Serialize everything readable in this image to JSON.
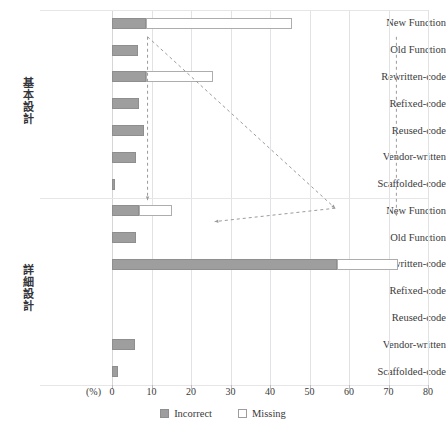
{
  "chart_data": {
    "type": "bar",
    "orientation": "horizontal",
    "stacked": true,
    "title": "",
    "xlabel": "(%)",
    "ylabel": "",
    "xlim": [
      0,
      80
    ],
    "xticks": [
      0,
      10,
      20,
      30,
      40,
      50,
      60,
      70,
      80
    ],
    "xtick_labels": [
      "0",
      "10",
      "20",
      "30",
      "40",
      "50",
      "60",
      "70",
      "80"
    ],
    "grid": true,
    "legend_position": "bottom-center",
    "legend": [
      "Incorrect",
      "Missing"
    ],
    "series": [
      {
        "name": "Incorrect",
        "color": "#9e9e9e",
        "values": [
          8.5,
          6.5,
          8.5,
          6.8,
          8.0,
          6.0,
          0.7,
          6.8,
          6.0,
          57.0,
          0.0,
          0.0,
          5.8,
          1.5
        ]
      },
      {
        "name": "Missing",
        "color": "#ffffff",
        "values": [
          37.0,
          0.0,
          17.0,
          0.0,
          0.0,
          0.0,
          0.0,
          8.5,
          0.0,
          15.5,
          0.0,
          0.0,
          0.0,
          0.0
        ]
      }
    ],
    "groups": [
      {
        "label": "基本設計",
        "categories": [
          "New Function",
          "Old Function",
          "Rewritten-code",
          "Refixed-code",
          "Reused-code",
          "Vendor-written",
          "Scaffolded-code"
        ]
      },
      {
        "label": "詳細設計",
        "categories": [
          "New Function",
          "Old Function",
          "Rewritten-code",
          "Refixed-code",
          "Reused-code",
          "Vendor-written",
          "Scaffolded-code"
        ]
      }
    ],
    "categories": [
      "New Function",
      "Old Function",
      "Rewritten-code",
      "Refixed-code",
      "Reused-code",
      "Vendor-written",
      "Scaffolded-code",
      "New Function",
      "Old Function",
      "Rewritten-code",
      "Refixed-code",
      "Reused-code",
      "Vendor-written",
      "Scaffolded-code"
    ],
    "annotations": [
      {
        "type": "dashed-connector",
        "style": "dashed",
        "color": "#9b9b9b",
        "from": [
          9.0,
          0.5
        ],
        "to": [
          9.0,
          6.6
        ],
        "note": "vertical dashed leader at ~9%"
      },
      {
        "type": "dashed-connector",
        "style": "dashed",
        "color": "#9b9b9b",
        "from": [
          9.0,
          0.5
        ],
        "to": [
          56.5,
          6.9
        ],
        "note": "diagonal dashed leader to right"
      },
      {
        "type": "dashed-connector",
        "style": "dashed",
        "color": "#9b9b9b",
        "from": [
          56.5,
          6.9
        ],
        "to": [
          26.0,
          7.4
        ],
        "note": "diagonal dashed leader returning left"
      },
      {
        "type": "dashed-connector",
        "style": "dashed",
        "color": "#9b9b9b",
        "from": [
          72.0,
          0.5
        ],
        "to": [
          72.0,
          7.2
        ],
        "note": "far right vertical dashed leader"
      }
    ]
  },
  "legend": {
    "incorrect_label": "Incorrect",
    "missing_label": "Missing"
  },
  "axis": {
    "unit_label": "(%)"
  }
}
